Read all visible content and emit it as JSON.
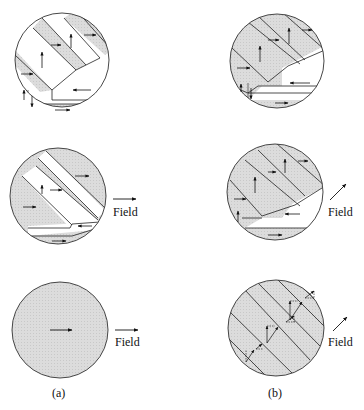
{
  "figure": {
    "columns": [
      {
        "caption": "(a)",
        "field_direction": "horizontal (right)"
      },
      {
        "caption": "(b)",
        "field_direction": "diagonal (up-right)"
      }
    ],
    "field_label": "Field",
    "panels": [
      {
        "id": "a1",
        "column": "a",
        "row": 1,
        "field_arrow": false,
        "description": "Demagnetized state: diagonal stripe domains with magnetization up and right, a left-pointing domain, and a closure domain at the bottom"
      },
      {
        "id": "a2",
        "column": "a",
        "row": 2,
        "field_arrow": true,
        "description": "Small horizontal field: right-pointing domains grow, up domains shrink to thin stripes"
      },
      {
        "id": "a3",
        "column": "a",
        "row": 3,
        "field_arrow": true,
        "description": "Saturated: single domain magnetized to the right"
      },
      {
        "id": "b1",
        "column": "b",
        "row": 1,
        "field_arrow": false,
        "description": "Demagnetized state: same domain configuration as (a)"
      },
      {
        "id": "b2",
        "column": "b",
        "row": 2,
        "field_arrow": true,
        "description": "Diagonal field: up and right domains grow, left domain shrinks"
      },
      {
        "id": "b3",
        "column": "b",
        "row": 3,
        "field_arrow": true,
        "description": "Magnetization rotating toward field: diagonal stripes with vector decomposition arrows"
      }
    ],
    "colors": {
      "shaded": "#d9d9d9",
      "unshaded": "#ffffff",
      "line": "#222222"
    }
  }
}
